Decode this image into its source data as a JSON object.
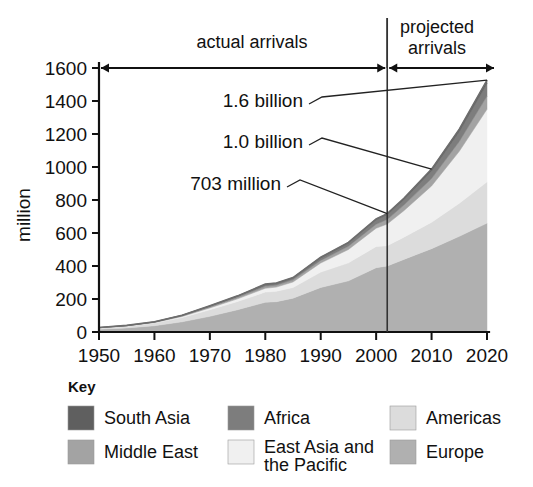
{
  "chart_data": {
    "type": "area",
    "title": "",
    "subtitle": "",
    "xlabel": "",
    "ylabel": "million",
    "xlim": [
      1950,
      2020
    ],
    "ylim": [
      0,
      1600
    ],
    "grid": false,
    "legend_position": "bottom",
    "legend_title": "Key",
    "stacked": true,
    "x_ticks": [
      "1950",
      "1960",
      "1970",
      "1980",
      "1990",
      "2000",
      "2010",
      "2020"
    ],
    "x_tick_values": [
      1950,
      1960,
      1970,
      1980,
      1990,
      2000,
      2010,
      2020
    ],
    "y_ticks": [
      "0",
      "200",
      "400",
      "600",
      "800",
      "1000",
      "1200",
      "1400",
      "1600"
    ],
    "y_tick_values": [
      0,
      200,
      400,
      600,
      800,
      1000,
      1200,
      1400,
      1600
    ],
    "x": [
      1950,
      1955,
      1960,
      1965,
      1970,
      1975,
      1980,
      1982,
      1985,
      1990,
      1995,
      2000,
      2002,
      2005,
      2010,
      2015,
      2020
    ],
    "series": [
      {
        "name": "Europe",
        "color": "#b0b0b0",
        "values": [
          17,
          25,
          38,
          62,
          95,
          135,
          180,
          184,
          205,
          270,
          310,
          390,
          400,
          440,
          505,
          580,
          660
        ]
      },
      {
        "name": "Americas",
        "color": "#dcdcdc",
        "values": [
          7,
          10,
          16,
          26,
          40,
          50,
          62,
          63,
          65,
          93,
          109,
          128,
          123,
          135,
          160,
          200,
          250
        ]
      },
      {
        "name": "East Asia and the Pacific",
        "color": "#f0f0f0",
        "values": [
          1,
          2,
          3,
          6,
          11,
          16,
          23,
          25,
          33,
          55,
          81,
          111,
          131,
          160,
          220,
          315,
          440
        ]
      },
      {
        "name": "Middle East",
        "color": "#a3a3a3",
        "values": [
          1,
          1,
          2,
          4,
          6,
          9,
          12,
          12,
          13,
          16,
          20,
          24,
          28,
          34,
          45,
          60,
          80
        ]
      },
      {
        "name": "Africa",
        "color": "#7d7d7d",
        "values": [
          1,
          1,
          2,
          3,
          5,
          7,
          10,
          10,
          11,
          15,
          19,
          27,
          29,
          34,
          46,
          60,
          77
        ]
      },
      {
        "name": "South Asia",
        "color": "#5f5f5f",
        "values": [
          0,
          1,
          1,
          1,
          2,
          2,
          3,
          3,
          3,
          4,
          4,
          6,
          6,
          7,
          11,
          14,
          19
        ]
      }
    ],
    "annotations": [
      {
        "label": "1.6 billion",
        "year": 2020,
        "value": 1526
      },
      {
        "label": "1.0 billion",
        "year": 2010,
        "value": 987
      },
      {
        "label": "703 million",
        "year": 2002,
        "value": 717
      }
    ],
    "span_labels": {
      "actual": "actual arrivals",
      "projected_line1": "projected",
      "projected_line2": "arrivals"
    },
    "divider_year": 2002
  },
  "legend": {
    "title": "Key",
    "entries": [
      {
        "label": "South Asia",
        "color": "#5f5f5f"
      },
      {
        "label": "Africa",
        "color": "#7d7d7d"
      },
      {
        "label": "Americas",
        "color": "#dcdcdc"
      },
      {
        "label": "Middle East",
        "color": "#a3a3a3"
      },
      {
        "label": "East Asia and the Pacific",
        "color": "#f0f0f0"
      },
      {
        "label": "Europe",
        "color": "#b0b0b0"
      }
    ]
  }
}
